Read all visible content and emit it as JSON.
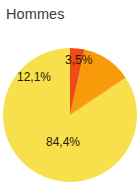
{
  "chart_data": {
    "type": "pie",
    "title": "Hommes",
    "xlabel": "",
    "ylabel": "",
    "categories": [
      "84,4%",
      "12,1%",
      "3,5%"
    ],
    "values": [
      84.4,
      12.1,
      3.5
    ],
    "labels": [
      "84,4%",
      "12,1%",
      "3,5%"
    ],
    "colors": [
      "#F8E04D",
      "#F99A0B",
      "#F04B14"
    ],
    "legend": "none",
    "grid": false,
    "start_angle_deg": 0,
    "direction": "counterclockwise",
    "slices": [
      {
        "label": "84,4%",
        "value": 84.4,
        "color": "#F8E04D"
      },
      {
        "label": "12,1%",
        "value": 12.1,
        "color": "#F99A0B"
      },
      {
        "label": "3,5%",
        "value": 3.5,
        "color": "#F04B14"
      }
    ]
  },
  "chart": {
    "title": "Hommes",
    "title_color": "#3b3b3b",
    "background_color": "#ffffff",
    "label_color": "#241a08"
  }
}
